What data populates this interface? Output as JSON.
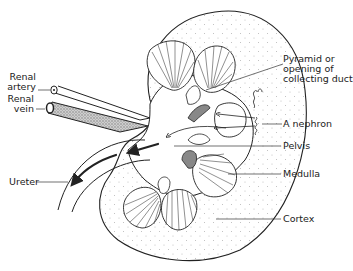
{
  "diagram": {
    "labels": {
      "renal_artery": [
        "Renal",
        "artery"
      ],
      "renal_vein": [
        "Renal",
        "vein"
      ],
      "ureter": "Ureter",
      "pyramid": [
        "Pyramid or",
        "opening of",
        "collecting duct"
      ],
      "nephron": "A nephron",
      "pelvis": "Pelvis",
      "medulla": "Medulla",
      "cortex": "Cortex"
    },
    "colors": {
      "line": "#222222",
      "stipple": "#b8b8b8",
      "vein_fill": "#9a9a9a",
      "background": "#ffffff"
    }
  }
}
